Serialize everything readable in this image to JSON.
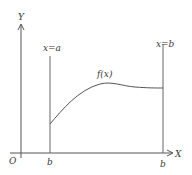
{
  "diagram": {
    "type": "function-area-diagram",
    "axes": {
      "y_label": "Y",
      "x_label": "X",
      "origin_label": "O"
    },
    "vertical_lines": [
      {
        "label": "x=a",
        "foot_label": "b"
      },
      {
        "label": "x=b",
        "foot_label": "b"
      }
    ],
    "curve": {
      "label": "f(x)"
    },
    "colors": {
      "line": "#555555",
      "text": "#3a3a3a",
      "background": "#ffffff"
    }
  }
}
